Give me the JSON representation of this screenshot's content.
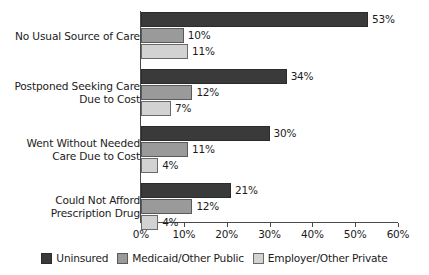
{
  "chart_data": {
    "type": "bar",
    "orientation": "horizontal",
    "title": "",
    "subtitle": "",
    "xlabel": "",
    "ylabel": "",
    "xlim": [
      0,
      60
    ],
    "xtick_labels": [
      "0%",
      "10%",
      "20%",
      "30%",
      "40%",
      "50%",
      "60%"
    ],
    "xticks": [
      0,
      10,
      20,
      30,
      40,
      50,
      60
    ],
    "grid": false,
    "legend_position": "bottom-center",
    "value_suffix": "%",
    "categories": [
      "No Usual Source of Care",
      "Postponed Seeking Care\nDue to Cost",
      "Went Without Needed\nCare Due to Cost",
      "Could Not Afford\nPrescription Drug"
    ],
    "series": [
      {
        "name": "Uninsured",
        "color": "#3a3a3a",
        "values": [
          53,
          34,
          30,
          21
        ],
        "labels": [
          "53%",
          "34%",
          "30%",
          "21%"
        ]
      },
      {
        "name": "Medicaid/Other Public",
        "color": "#9a9a9a",
        "values": [
          10,
          12,
          11,
          12
        ],
        "labels": [
          "10%",
          "12%",
          "11%",
          "12%"
        ]
      },
      {
        "name": "Employer/Other Private",
        "color": "#d2d2d2",
        "values": [
          11,
          7,
          4,
          4
        ],
        "labels": [
          "11%",
          "7%",
          "4%",
          "4%"
        ]
      }
    ]
  }
}
